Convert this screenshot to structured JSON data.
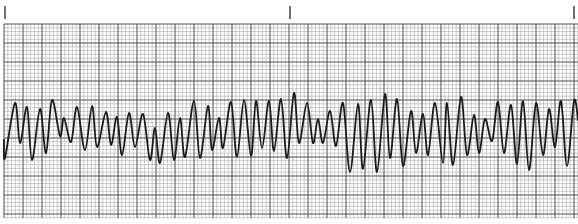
{
  "chart_data": {
    "type": "line",
    "title": "",
    "xlabel": "",
    "ylabel": "",
    "grid": true,
    "legend": null,
    "paper": {
      "background": "#ffffff",
      "minor_grid_color": "#9a9a9a",
      "major_grid_color": "#3a3a3a",
      "trace_color": "#1a1a1a",
      "minor_spacing_px": 3.8,
      "major_every_minor": 5,
      "grid_left_px": 4,
      "grid_top_px": 24,
      "grid_right_px": 578,
      "grid_bottom_px": 218
    },
    "time_marks_px": [
      5,
      290,
      574
    ],
    "baseline_y_px": 131,
    "trace_points_px": [
      [
        4,
        140
      ],
      [
        5,
        158
      ],
      [
        15,
        103
      ],
      [
        20,
        143
      ],
      [
        27,
        107
      ],
      [
        32,
        160
      ],
      [
        40,
        109
      ],
      [
        46,
        153
      ],
      [
        52,
        100
      ],
      [
        60,
        136
      ],
      [
        64,
        118
      ],
      [
        71,
        142
      ],
      [
        77,
        107
      ],
      [
        85,
        150
      ],
      [
        92,
        106
      ],
      [
        97,
        147
      ],
      [
        106,
        112
      ],
      [
        111,
        145
      ],
      [
        117,
        117
      ],
      [
        122,
        155
      ],
      [
        129,
        113
      ],
      [
        135,
        147
      ],
      [
        143,
        114
      ],
      [
        150,
        160
      ],
      [
        155,
        128
      ],
      [
        160,
        163
      ],
      [
        168,
        113
      ],
      [
        174,
        160
      ],
      [
        180,
        118
      ],
      [
        185,
        157
      ],
      [
        194,
        101
      ],
      [
        200,
        158
      ],
      [
        208,
        106
      ],
      [
        212,
        150
      ],
      [
        219,
        118
      ],
      [
        223,
        148
      ],
      [
        231,
        102
      ],
      [
        237,
        157
      ],
      [
        244,
        100
      ],
      [
        251,
        156
      ],
      [
        256,
        101
      ],
      [
        262,
        148
      ],
      [
        269,
        101
      ],
      [
        274,
        151
      ],
      [
        281,
        99
      ],
      [
        287,
        158
      ],
      [
        294,
        93
      ],
      [
        299,
        143
      ],
      [
        307,
        103
      ],
      [
        313,
        143
      ],
      [
        318,
        119
      ],
      [
        323,
        143
      ],
      [
        330,
        111
      ],
      [
        336,
        146
      ],
      [
        343,
        103
      ],
      [
        350,
        172
      ],
      [
        358,
        104
      ],
      [
        363,
        169
      ],
      [
        371,
        100
      ],
      [
        377,
        172
      ],
      [
        385,
        94
      ],
      [
        390,
        158
      ],
      [
        397,
        99
      ],
      [
        403,
        166
      ],
      [
        411,
        111
      ],
      [
        416,
        153
      ],
      [
        423,
        114
      ],
      [
        428,
        155
      ],
      [
        435,
        103
      ],
      [
        443,
        163
      ],
      [
        447,
        103
      ],
      [
        453,
        165
      ],
      [
        461,
        97
      ],
      [
        467,
        155
      ],
      [
        474,
        115
      ],
      [
        479,
        153
      ],
      [
        485,
        119
      ],
      [
        492,
        141
      ],
      [
        498,
        102
      ],
      [
        504,
        153
      ],
      [
        511,
        105
      ],
      [
        517,
        164
      ],
      [
        523,
        101
      ],
      [
        529,
        170
      ],
      [
        536,
        103
      ],
      [
        543,
        155
      ],
      [
        549,
        109
      ],
      [
        555,
        147
      ],
      [
        561,
        101
      ],
      [
        567,
        166
      ],
      [
        574,
        101
      ],
      [
        578,
        120
      ]
    ]
  }
}
